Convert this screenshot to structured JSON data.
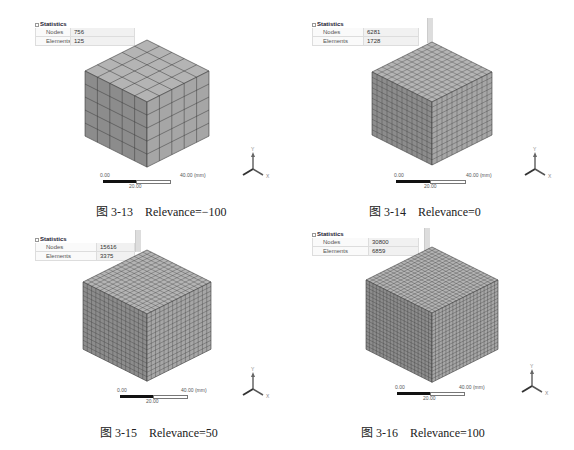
{
  "panels": [
    {
      "stats": {
        "title": "Statistics",
        "rows": [
          {
            "label": "Nodes",
            "value": "756"
          },
          {
            "label": "Elements",
            "value": "125"
          }
        ]
      },
      "divisions": 5,
      "scale": {
        "start": "0.00",
        "mid": "20.00",
        "end": "40.00 (mm)"
      },
      "axis": {
        "y": "Y",
        "x": "X"
      },
      "caption": "图 3-13    Relevance=−100"
    },
    {
      "stats": {
        "title": "Statistics",
        "rows": [
          {
            "label": "Nodes",
            "value": "6281"
          },
          {
            "label": "Elements",
            "value": "1728"
          }
        ]
      },
      "divisions": 12,
      "scale": {
        "start": "0.00",
        "mid": "20.00",
        "end": "40.00 (mm)"
      },
      "axis": {
        "y": "Y",
        "x": "X"
      },
      "caption": "图 3-14    Relevance=0"
    },
    {
      "stats": {
        "title": "Statistics",
        "rows": [
          {
            "label": "Nodes",
            "value": "15616"
          },
          {
            "label": "Elements",
            "value": "3375"
          }
        ]
      },
      "divisions": 15,
      "scale": {
        "start": "0.00",
        "mid": "20.00",
        "end": "40.00 (mm)"
      },
      "axis": {
        "y": "Y",
        "x": "X"
      },
      "caption": "图 3-15    Relevance=50"
    },
    {
      "stats": {
        "title": "Statistics",
        "rows": [
          {
            "label": "Nodes",
            "value": "30800"
          },
          {
            "label": "Elements",
            "value": "6859"
          }
        ]
      },
      "divisions": 19,
      "scale": {
        "start": "0.00",
        "mid": "20.00",
        "end": "40.00 (mm)"
      },
      "axis": {
        "y": "Y",
        "x": "X"
      },
      "caption": "图 3-16    Relevance=100"
    }
  ],
  "colors": {
    "top": "#b4b4b4",
    "left": "#8c8c8c",
    "right": "#a6a6a6",
    "grid": "#3a3a3a"
  }
}
